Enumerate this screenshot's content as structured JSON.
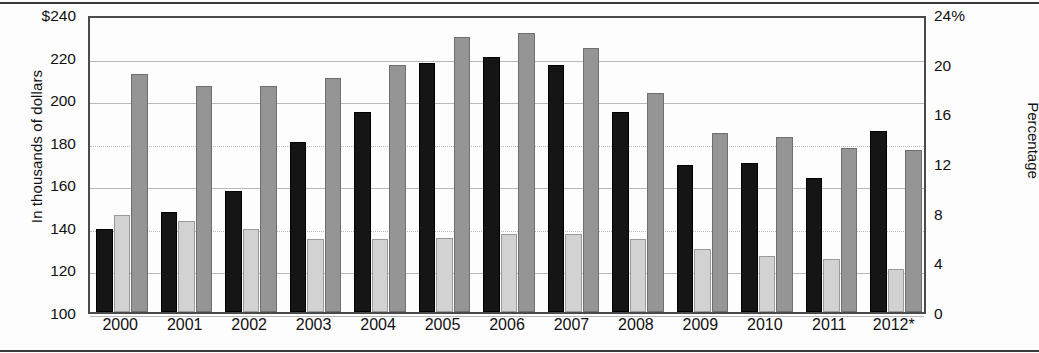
{
  "chart_data": {
    "type": "bar",
    "title": "",
    "categories": [
      "2000",
      "2001",
      "2002",
      "2003",
      "2004",
      "2005",
      "2006",
      "2007",
      "2008",
      "2009",
      "2010",
      "2011",
      "2012*"
    ],
    "series": [
      {
        "name": "black-series",
        "axis": "left",
        "color": "#151515",
        "values": [
          139,
          147,
          157,
          180,
          194,
          217,
          220,
          216,
          194,
          169,
          170,
          163,
          185
        ]
      },
      {
        "name": "light-gray-series",
        "axis": "right",
        "color": "#d2d2d2",
        "values": [
          7.8,
          7.3,
          6.7,
          5.9,
          5.9,
          6.0,
          6.3,
          6.3,
          5.9,
          5.1,
          4.5,
          4.3,
          3.5
        ]
      },
      {
        "name": "dark-gray-series",
        "axis": "left",
        "color": "#959595",
        "values": [
          212,
          206,
          206,
          210,
          216,
          229,
          231,
          224,
          203,
          184,
          182,
          177,
          176
        ]
      }
    ],
    "left_axis": {
      "label": "In thousands of dollars",
      "ticks": [
        "$240",
        "220",
        "200",
        "180",
        "160",
        "140",
        "120",
        "100"
      ],
      "values": [
        240,
        220,
        200,
        180,
        160,
        140,
        120,
        100
      ],
      "min": 100,
      "max": 240
    },
    "right_axis": {
      "label": "Percentage",
      "ticks": [
        "24%",
        "20",
        "16",
        "12",
        "8",
        "4",
        "0"
      ],
      "values": [
        24,
        20,
        16,
        12,
        8,
        4,
        0
      ],
      "min": 0,
      "max": 24
    },
    "xlabel": "",
    "grid": true,
    "legend": "none"
  }
}
